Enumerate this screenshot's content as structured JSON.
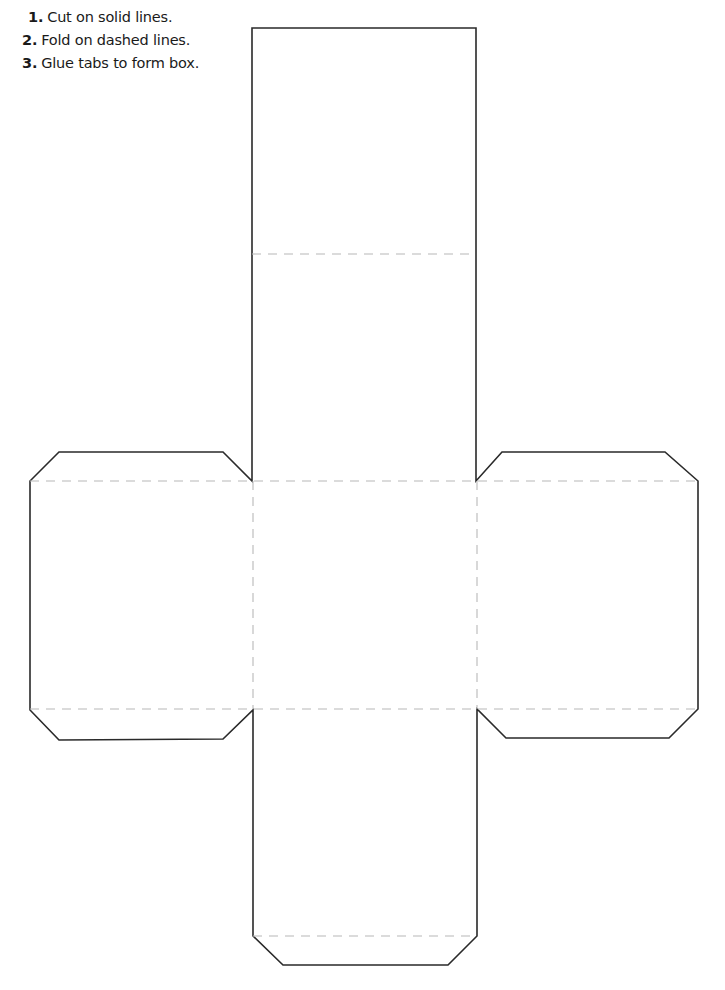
{
  "instructions": [
    {
      "number": "1.",
      "text": "Cut on solid lines."
    },
    {
      "number": "2.",
      "text": "Fold on dashed lines."
    },
    {
      "number": "3.",
      "text": "Glue tabs to form box."
    }
  ],
  "template": {
    "shape": "box-net",
    "line_styles": {
      "cut": "solid",
      "fold": "dashed"
    },
    "colors": {
      "cut_line": "#2a2a2a",
      "fold_line": "#b8b8b8",
      "background": "#ffffff"
    }
  }
}
